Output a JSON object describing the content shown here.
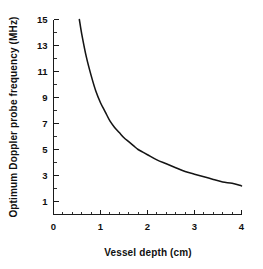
{
  "chart_data": {
    "type": "line",
    "title": "",
    "xlabel": "Vessel depth (cm)",
    "ylabel": "Optimum Doppler probe frequency (MHz)",
    "xlim": [
      0,
      4
    ],
    "ylim": [
      0,
      15
    ],
    "grid": false,
    "legend": null,
    "x_ticks": [
      0,
      1,
      2,
      3,
      4
    ],
    "x_tick_labels": [
      "0",
      "1",
      "2",
      "3",
      "4"
    ],
    "x_minor_tick_step": 0.2,
    "y_ticks": [
      1,
      3,
      5,
      7,
      9,
      11,
      13,
      15
    ],
    "y_tick_labels": [
      "1",
      "3",
      "5",
      "7",
      "9",
      "11",
      "13",
      "15"
    ],
    "y_minor_tick_step": 1,
    "series": [
      {
        "name": "Optimum Doppler probe frequency",
        "color": "#141414",
        "x": [
          0.55,
          0.6,
          0.7,
          0.8,
          0.9,
          1.0,
          1.1,
          1.2,
          1.3,
          1.4,
          1.5,
          1.6,
          1.7,
          1.8,
          1.9,
          2.0,
          2.2,
          2.4,
          2.6,
          2.8,
          3.0,
          3.2,
          3.4,
          3.6,
          3.8,
          4.0
        ],
        "y": [
          15.0,
          13.9,
          12.1,
          10.7,
          9.5,
          8.6,
          7.9,
          7.2,
          6.7,
          6.3,
          5.9,
          5.6,
          5.3,
          5.0,
          4.8,
          4.6,
          4.2,
          3.9,
          3.6,
          3.3,
          3.1,
          2.9,
          2.7,
          2.5,
          2.4,
          2.2
        ]
      }
    ],
    "annotations": []
  },
  "colors": {
    "ink": "#141414",
    "background": "#ffffff"
  }
}
